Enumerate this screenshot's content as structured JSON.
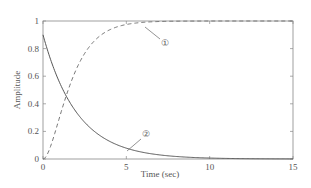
{
  "chart_data": {
    "type": "line",
    "title": "",
    "xlabel": "Time (sec)",
    "ylabel": "Amplitude",
    "xlim": [
      0,
      15
    ],
    "ylim": [
      0,
      1
    ],
    "xticks": [
      0,
      5,
      10,
      15
    ],
    "yticks": [
      0,
      0.2,
      0.4,
      0.6,
      0.8,
      1
    ],
    "xtick_labels": [
      "0",
      "5",
      "10",
      "15"
    ],
    "ytick_labels": [
      "0",
      "0.2",
      "0.4",
      "0.6",
      "0.8",
      "1"
    ],
    "grid": false,
    "legend": null,
    "series": [
      {
        "name": "①",
        "style": "dashed",
        "x": [
          0,
          0.5,
          1,
          1.5,
          2,
          2.5,
          3,
          4,
          5,
          6,
          7,
          8,
          10,
          12,
          15
        ],
        "values": [
          0,
          0.1,
          0.3,
          0.5,
          0.65,
          0.77,
          0.85,
          0.93,
          0.97,
          0.985,
          0.993,
          0.997,
          1.0,
          1.0,
          1.0
        ]
      },
      {
        "name": "②",
        "style": "solid",
        "x": [
          0,
          0.5,
          1,
          1.5,
          2,
          2.5,
          3,
          4,
          5,
          6,
          7,
          8,
          10,
          12,
          15
        ],
        "values": [
          0.9,
          0.72,
          0.57,
          0.45,
          0.36,
          0.29,
          0.23,
          0.15,
          0.08,
          0.05,
          0.03,
          0.02,
          0.01,
          0.005,
          0.0
        ]
      }
    ],
    "annotations": [
      {
        "label": "①",
        "target_x": 6.1,
        "target_y": 0.98
      },
      {
        "label": "②",
        "target_x": 5.1,
        "target_y": 0.08
      }
    ]
  },
  "labels": {
    "xlabel": "Time (sec)",
    "ylabel": "Amplitude",
    "ann1": "①",
    "ann2": "②"
  }
}
